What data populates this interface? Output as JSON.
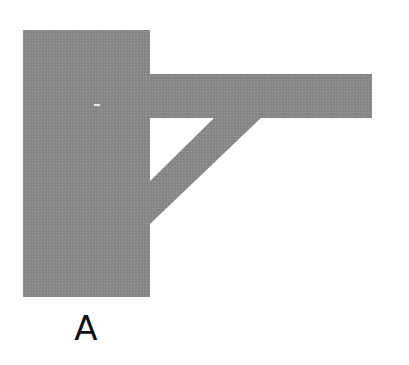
{
  "figure": {
    "label": "A",
    "fill_color": "#8a8a8a",
    "background_color": "#ffffff",
    "shapes": {
      "wall": {
        "x": 23,
        "y": 30,
        "width": 127,
        "height": 267
      },
      "beam": {
        "x": 150,
        "y": 74,
        "width": 222,
        "height": 44
      },
      "brace": {
        "points": "218,117 262,117 150,224 150,183"
      }
    }
  }
}
